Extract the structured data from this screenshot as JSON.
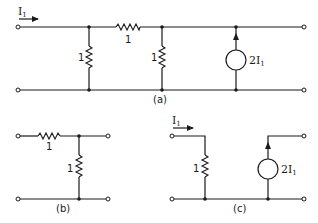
{
  "figure": {
    "colors": {
      "ink": "#1a1a1a",
      "background": "#ffffff"
    },
    "diagram_a": {
      "caption": "(a)",
      "input_current_label": "I",
      "input_current_sub": "1",
      "series_resistor_label": "1",
      "shunt_resistor_1_label": "1",
      "shunt_resistor_2_label": "1",
      "source_label_coef": "2I",
      "source_label_sub": "1"
    },
    "diagram_b": {
      "caption": "(b)",
      "series_resistor_label": "1",
      "shunt_resistor_label": "1"
    },
    "diagram_c": {
      "caption": "(c)",
      "input_current_label": "I",
      "input_current_sub": "1",
      "shunt_resistor_label": "1",
      "source_label_coef": "2I",
      "source_label_sub": "1"
    }
  }
}
